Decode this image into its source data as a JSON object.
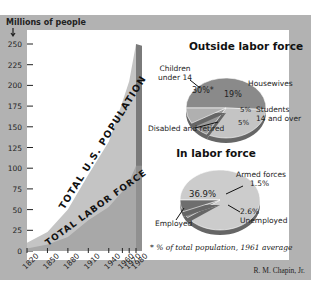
{
  "chart_data": [
    {
      "type": "area",
      "title": "",
      "ylabel": "Millions of people",
      "xlabel": "",
      "ylim": [
        0,
        260
      ],
      "yticks": [
        0,
        25,
        50,
        75,
        100,
        125,
        150,
        175,
        200,
        225,
        250
      ],
      "xticks": [
        1820,
        1850,
        1880,
        1910,
        1940,
        1960,
        1970,
        1980
      ],
      "x": [
        1820,
        1850,
        1880,
        1910,
        1940,
        1960,
        1970,
        1980
      ],
      "series": [
        {
          "name": "TOTAL U.S. POPULATION",
          "values": [
            10,
            23,
            50,
            92,
            132,
            180,
            205,
            250
          ]
        },
        {
          "name": "TOTAL LABOR FORCE",
          "values": [
            3,
            8,
            17,
            37,
            53,
            72,
            84,
            103
          ]
        }
      ]
    },
    {
      "type": "pie",
      "title": "Outside labor force",
      "slices": [
        {
          "label": "Children under 14",
          "value": 30,
          "text": "30%*"
        },
        {
          "label": "Housewives",
          "value": 19,
          "text": "19%"
        },
        {
          "label": "Students 14 and over",
          "value": 5,
          "text": "5%"
        },
        {
          "label": "Disabled and retired",
          "value": 5,
          "text": "5%"
        }
      ]
    },
    {
      "type": "pie",
      "title": "In labor force",
      "slices": [
        {
          "label": "Employed",
          "value": 36.9,
          "text": "36.9%"
        },
        {
          "label": "Armed forces",
          "value": 1.5,
          "text": "1.5%"
        },
        {
          "label": "Unemployed",
          "value": 2.6,
          "text": "2.6%"
        }
      ]
    }
  ],
  "labels": {
    "y_axis_title": "Millions of people",
    "population_label": "TOTAL U.S. POPULATION",
    "labor_label": "TOTAL LABOR FORCE",
    "children_line1": "Children",
    "children_line2": "under 14",
    "housewives": "Housewives",
    "students_line1": "Students",
    "students_line2": "14 and over",
    "disabled": "Disabled and retired",
    "armed_line1": "Armed forces",
    "armed_line2": "1.5%",
    "unemployed_val": "2.6%",
    "unemployed": "Unemployed",
    "employed": "Employed",
    "employed_val": "36.9%",
    "children_val": "30%*",
    "housewives_val": "19%",
    "students_val": "5%",
    "disabled_val": "5%",
    "footnote": "* % of total population, 1961 average",
    "credit": "R. M. Chapin, Jr."
  },
  "colors": {
    "frame": "#b2b2b2",
    "population_fill": "#c4c4c4",
    "labor_fill": "#a8a8a8",
    "pie_dark": "#8a8a8a",
    "pie_light": "#c8c8c8"
  }
}
